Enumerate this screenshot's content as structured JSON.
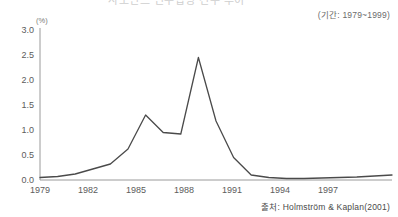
{
  "title_strip": {
    "text": "사모펀드 인수합병 건수 추이"
  },
  "period_note": "(기간: 1979~1999)",
  "source_note": "출처: Holmström & Kaplan(2001)",
  "axes": {
    "y_unit": "(%)",
    "y_ticks": [
      "0.0",
      "0.5",
      "1.0",
      "1.5",
      "2.0",
      "2.5",
      "3.0"
    ],
    "x_ticks": [
      "1979",
      "1982",
      "1985",
      "1988",
      "1991",
      "1994",
      "1997"
    ]
  },
  "chart_data": {
    "type": "line",
    "title": "사모펀드 인수합병 건수 추이",
    "subtitle": "(기간: 1979~1999)",
    "source": "출처: Holmström & Kaplan(2001)",
    "xlabel": "",
    "ylabel": "(%)",
    "ylim": [
      0.0,
      3.0
    ],
    "xlim": [
      1979,
      1999
    ],
    "y_tick_values": [
      0.0,
      0.5,
      1.0,
      1.5,
      2.0,
      2.5,
      3.0
    ],
    "x_tick_values": [
      1979,
      1982,
      1985,
      1988,
      1991,
      1994,
      1997
    ],
    "grid": false,
    "legend": "none",
    "series": [
      {
        "name": "인수합병 비율",
        "color": "#4a4a4a",
        "x": [
          1979,
          1980,
          1981,
          1982,
          1983,
          1984,
          1985,
          1986,
          1987,
          1988,
          1989,
          1990,
          1991,
          1992,
          1993,
          1994,
          1995,
          1996,
          1997,
          1998,
          1999
        ],
        "values": [
          0.05,
          0.07,
          0.12,
          0.22,
          0.32,
          0.62,
          1.3,
          0.95,
          0.92,
          2.45,
          1.18,
          0.45,
          0.1,
          0.05,
          0.03,
          0.03,
          0.04,
          0.05,
          0.06,
          0.08,
          0.1
        ]
      }
    ]
  }
}
